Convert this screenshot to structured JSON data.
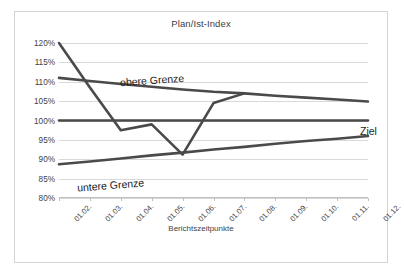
{
  "chart_data": {
    "type": "line",
    "title": "Plan/Ist-Index",
    "xlabel": "Berichtszeitpunkte",
    "ylabel": "",
    "categories": [
      "01.02.",
      "01.03.",
      "01.04.",
      "01.05.",
      "01.06.",
      "01.07.",
      "01.08.",
      "01.09.",
      "01.10.",
      "01.11.",
      "01.12."
    ],
    "ylim": [
      80,
      120
    ],
    "ytick_step": 5,
    "ytick_labels": [
      "120%",
      "115%",
      "110%",
      "105%",
      "100%",
      "95%",
      "90%",
      "85%",
      "80%"
    ],
    "ytick_values": [
      120,
      115,
      110,
      105,
      100,
      95,
      90,
      85,
      80
    ],
    "grid": true,
    "legend": "annotations-inline",
    "series": [
      {
        "name": "Ist",
        "annotation": "",
        "color": "#4a4a4a",
        "values": [
          120,
          108.5,
          97.5,
          99,
          91.2,
          104.5,
          107,
          null,
          null,
          null,
          null
        ]
      },
      {
        "name": "obere Grenze",
        "annotation": "obere Grenze",
        "color": "#4a4a4a",
        "values": [
          111,
          110.2,
          109.4,
          108.7,
          108,
          107.4,
          107,
          106.4,
          105.9,
          105.4,
          104.9
        ]
      },
      {
        "name": "Ziel",
        "annotation": "Ziel",
        "color": "#4a4a4a",
        "values": [
          100,
          100,
          100,
          100,
          100,
          100,
          100,
          100,
          100,
          100,
          100
        ]
      },
      {
        "name": "untere Grenze",
        "annotation": "untere Grenze",
        "color": "#4a4a4a",
        "values": [
          88.7,
          89.4,
          90.2,
          91,
          91.7,
          92.5,
          93.2,
          94,
          94.7,
          95.3,
          96
        ]
      }
    ],
    "annotations": [
      {
        "text": "obere Grenze",
        "series": "obere Grenze"
      },
      {
        "text": "Ziel",
        "series": "Ziel"
      },
      {
        "text": "untere Grenze",
        "series": "untere Grenze"
      }
    ]
  }
}
